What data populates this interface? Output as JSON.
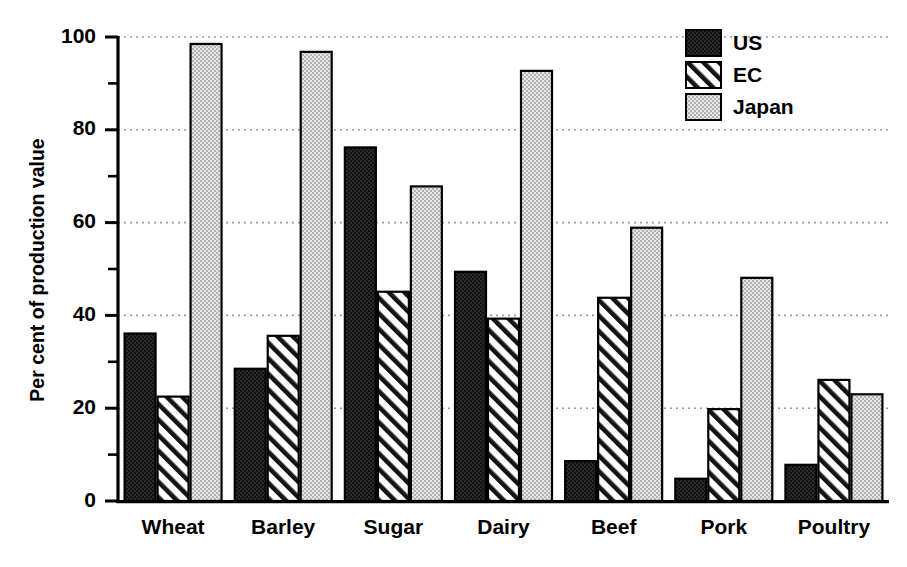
{
  "chart_data": {
    "type": "bar",
    "title": "",
    "subtitle": "",
    "xlabel": "",
    "ylabel": "Per cent of production value",
    "ylim": [
      0,
      100
    ],
    "ytick_values": [
      0,
      20,
      40,
      60,
      80,
      100
    ],
    "ytick_labels": [
      "0",
      "20",
      "40",
      "60",
      "80",
      "100"
    ],
    "yminor_tick_values": [
      10,
      30,
      50,
      70,
      90
    ],
    "grid": "horizontal-dotted-at-major-ticks",
    "legend_position": "top-right",
    "categories": [
      "Wheat",
      "Barley",
      "Sugar",
      "Dairy",
      "Beef",
      "Pork",
      "Poultry"
    ],
    "series": [
      {
        "name": "US",
        "fill": "solid-black",
        "color": "#111111",
        "values": [
          36.1,
          28.5,
          76.2,
          49.4,
          8.6,
          4.8,
          7.8
        ]
      },
      {
        "name": "EC",
        "fill": "diagonal-hatch",
        "color": "#ffffff",
        "values": [
          22.5,
          35.6,
          45.1,
          39.3,
          43.8,
          19.8,
          26.1
        ]
      },
      {
        "name": "Japan",
        "fill": "light-gray-stipple",
        "color": "#d0d0d0",
        "values": [
          98.5,
          96.8,
          67.8,
          92.7,
          58.9,
          48.1,
          23.0
        ]
      }
    ]
  },
  "legend": {
    "entries": [
      {
        "label": "US"
      },
      {
        "label": "EC"
      },
      {
        "label": "Japan"
      }
    ]
  },
  "axes": {
    "y_axis_title": "Per cent of production value"
  },
  "colors": {
    "background": "#ffffff",
    "axis": "#000000",
    "grid": "#9a9a9a",
    "us_fill": "#111111",
    "ec_fill": "#ffffff",
    "japan_fill": "#d2d2d2"
  }
}
